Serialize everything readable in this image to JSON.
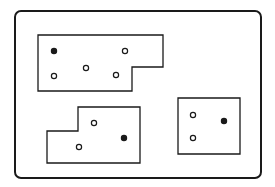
{
  "diagram": {
    "canvas": {
      "width": 275,
      "height": 187,
      "background": "#ffffff"
    },
    "stroke_color": "#1a1a1a",
    "frame": {
      "x": 15,
      "y": 11,
      "width": 246,
      "height": 167,
      "radius": 6,
      "stroke_width": 2
    },
    "regions": [
      {
        "id": "region-top-left",
        "shape": "L-polygon",
        "points": "38,35 163,35 163,67 132,67 132,91 38,91",
        "dots": [
          {
            "x": 54,
            "y": 51,
            "filled": true
          },
          {
            "x": 125,
            "y": 51,
            "filled": false
          },
          {
            "x": 86,
            "y": 68,
            "filled": false
          },
          {
            "x": 54,
            "y": 76,
            "filled": false
          },
          {
            "x": 116,
            "y": 75,
            "filled": false
          }
        ]
      },
      {
        "id": "region-bottom-left",
        "shape": "L-polygon",
        "points": "78,107 140,107 140,163 47,163 47,131 78,131",
        "dots": [
          {
            "x": 94,
            "y": 123,
            "filled": false
          },
          {
            "x": 124,
            "y": 138,
            "filled": true
          },
          {
            "x": 79,
            "y": 147,
            "filled": false
          }
        ]
      },
      {
        "id": "region-right",
        "shape": "rectangle",
        "points": "178,98 240,98 240,154 178,154",
        "dots": [
          {
            "x": 193,
            "y": 115,
            "filled": false
          },
          {
            "x": 224,
            "y": 121,
            "filled": true
          },
          {
            "x": 193,
            "y": 138,
            "filled": false
          }
        ]
      }
    ],
    "dot_radius": 2.6
  }
}
